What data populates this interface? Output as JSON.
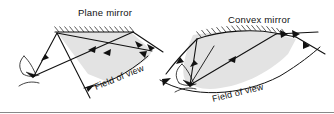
{
  "figure": {
    "width": 334,
    "height": 114,
    "background_color": "#ffffff",
    "ink_color": "#111111",
    "fov_shade_color": "#e3e3e3",
    "rule_color": "#6a6a6a"
  },
  "panels": [
    {
      "id": "plane-mirror-panel",
      "heading": "Plane mirror",
      "fov_label": "Field of view",
      "mirror_type": "plane",
      "mirror_surface": "flat hatched line",
      "observer": "eye",
      "fov_label_rotation_deg": -22,
      "heading_x": 78,
      "heading_y": 16
    },
    {
      "id": "convex-mirror-panel",
      "heading": "Convex mirror",
      "fov_label": "Field of view",
      "mirror_type": "convex",
      "mirror_surface": "curved hatched arc",
      "observer": "eye",
      "fov_label_rotation_deg": -14,
      "heading_x": 228,
      "heading_y": 23
    }
  ],
  "annotations": {
    "ray_arrow_count_plane": 6,
    "ray_arrow_count_convex": 7,
    "shading_meaning": "shaded wedge marks the region visible in the mirror"
  }
}
